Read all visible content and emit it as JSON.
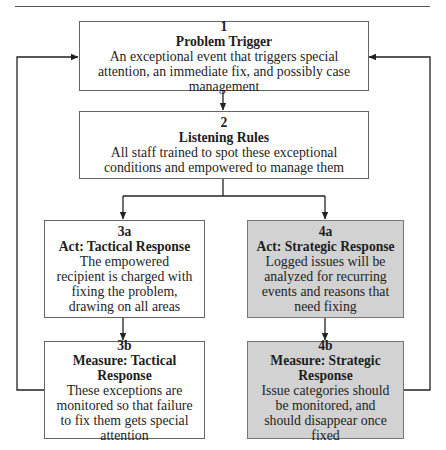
{
  "diagram": {
    "type": "flowchart",
    "nodes": [
      {
        "id": "1",
        "number": "1",
        "title": "Problem Trigger",
        "description": "An exceptional event that triggers special attention, an immediate fix, and possibly case management",
        "shaded": false
      },
      {
        "id": "2",
        "number": "2",
        "title": "Listening Rules",
        "description": "All staff trained to spot these exceptional conditions and empowered to manage them",
        "shaded": false
      },
      {
        "id": "3a",
        "number": "3a",
        "title": "Act: Tactical Response",
        "description": "The empowered recipient is charged with fixing the problem, drawing on all areas",
        "shaded": false
      },
      {
        "id": "4a",
        "number": "4a",
        "title": "Act: Strategic Response",
        "description": "Logged issues will be analyzed for recurring events and reasons that need fixing",
        "shaded": true
      },
      {
        "id": "3b",
        "number": "3b",
        "title": "Measure: Tactical Response",
        "description": "These exceptions are monitored so that failure to fix them gets special attention",
        "shaded": false
      },
      {
        "id": "4b",
        "number": "4b",
        "title": "Measure: Strategic Response",
        "description": "Issue categories should be monitored, and should disappear once fixed",
        "shaded": true
      }
    ],
    "edges": [
      {
        "from": "1",
        "to": "2"
      },
      {
        "from": "2",
        "to": "3a"
      },
      {
        "from": "2",
        "to": "4a"
      },
      {
        "from": "3a",
        "to": "3b"
      },
      {
        "from": "4a",
        "to": "4b"
      },
      {
        "from": "3b",
        "to": "1",
        "kind": "feedback-left"
      },
      {
        "from": "4b",
        "to": "1",
        "kind": "feedback-right"
      }
    ],
    "colors": {
      "shaded_fill": "#d2d2d2",
      "plain_fill": "#ffffff",
      "line": "#222222"
    }
  }
}
